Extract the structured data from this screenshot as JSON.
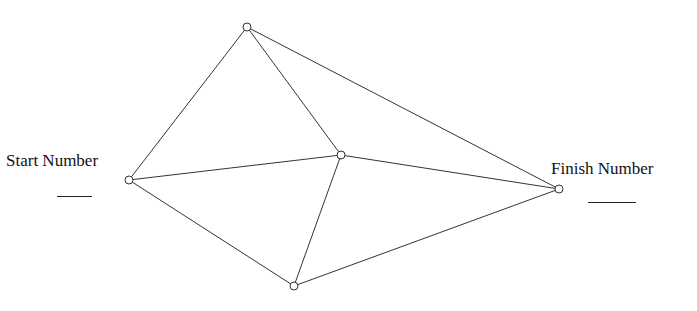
{
  "labels": {
    "start": "Start Number",
    "finish": "Finish Number"
  },
  "nodes": [
    {
      "id": "top",
      "x": 247,
      "y": 27
    },
    {
      "id": "center",
      "x": 341,
      "y": 155
    },
    {
      "id": "left",
      "x": 129,
      "y": 180
    },
    {
      "id": "right",
      "x": 559,
      "y": 189
    },
    {
      "id": "bottom",
      "x": 294,
      "y": 286
    }
  ],
  "edges": [
    [
      "left",
      "top"
    ],
    [
      "top",
      "center"
    ],
    [
      "top",
      "right"
    ],
    [
      "left",
      "center"
    ],
    [
      "center",
      "right"
    ],
    [
      "left",
      "bottom"
    ],
    [
      "center",
      "bottom"
    ],
    [
      "bottom",
      "right"
    ]
  ],
  "colors": {
    "line": "#333333",
    "node_fill": "#ffffff"
  }
}
